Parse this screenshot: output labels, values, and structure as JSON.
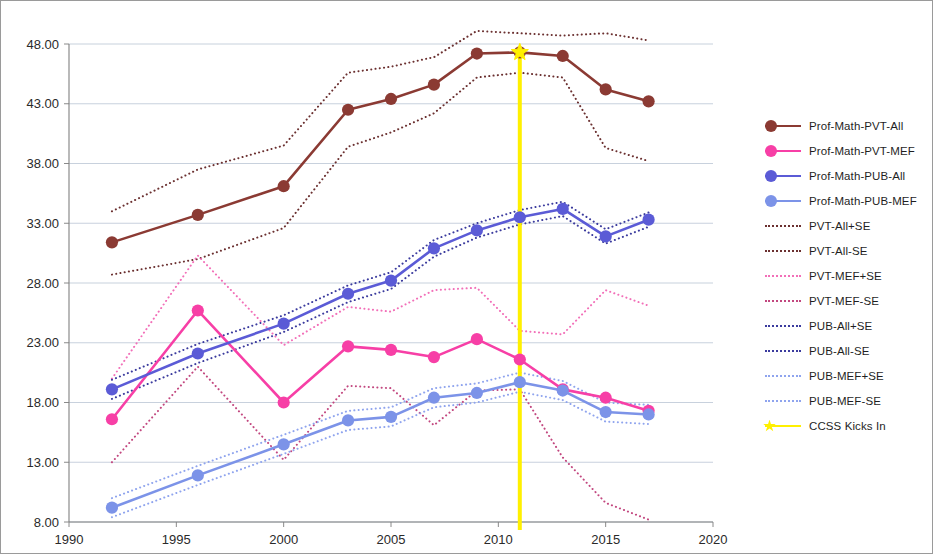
{
  "chart_data": {
    "type": "line",
    "title": "",
    "xlabel": "",
    "ylabel": "",
    "xlim": [
      1990,
      2020
    ],
    "ylim": [
      8,
      48
    ],
    "xticks": [
      1990,
      1995,
      2000,
      2005,
      2010,
      2015,
      2020
    ],
    "yticks": [
      "8.00",
      "13.00",
      "18.00",
      "23.00",
      "28.00",
      "33.00",
      "38.00",
      "43.00",
      "48.00"
    ],
    "grid": true,
    "legend_position": "right",
    "x": [
      1992,
      1996,
      2000,
      2003,
      2005,
      2007,
      2009,
      2011,
      2013,
      2015,
      2017
    ],
    "series": [
      {
        "name": "Prof-Math-PVT-All",
        "color": "#8B3A33",
        "style": "solid-marker",
        "values": [
          31.4,
          33.7,
          36.1,
          42.5,
          43.4,
          44.6,
          47.2,
          47.3,
          47.0,
          44.2,
          43.2
        ]
      },
      {
        "name": "Prof-Math-PVT-MEF",
        "color": "#F73FA6",
        "style": "solid-marker",
        "values": [
          16.6,
          25.7,
          18.0,
          22.7,
          22.4,
          21.8,
          23.3,
          21.6,
          19.1,
          18.4,
          17.3
        ]
      },
      {
        "name": "Prof-Math-PUB-All",
        "color": "#5B5BD6",
        "style": "solid-marker",
        "values": [
          19.1,
          22.1,
          24.6,
          27.1,
          28.2,
          30.9,
          32.4,
          33.5,
          34.2,
          31.9,
          33.3
        ]
      },
      {
        "name": "Prof-Math-PUB-MEF",
        "color": "#7C93E8",
        "style": "solid-marker",
        "values": [
          9.2,
          11.9,
          14.5,
          16.5,
          16.8,
          18.4,
          18.8,
          19.7,
          19.0,
          17.2,
          17.0
        ]
      },
      {
        "name": "PVT-All+SE",
        "color": "#6B3030",
        "style": "dotted",
        "values": [
          34.0,
          37.5,
          39.5,
          45.6,
          46.1,
          46.9,
          49.1,
          48.9,
          48.7,
          48.9,
          48.3
        ]
      },
      {
        "name": "PVT-All-SE",
        "color": "#6B3030",
        "style": "dotted",
        "values": [
          28.7,
          30.0,
          32.6,
          39.4,
          40.6,
          42.2,
          45.2,
          45.6,
          45.2,
          39.3,
          38.2
        ]
      },
      {
        "name": "PVT-MEF+SE",
        "color": "#F26FB8",
        "style": "dotted",
        "values": [
          20.0,
          30.3,
          22.8,
          26.0,
          25.6,
          27.4,
          27.6,
          24.0,
          23.7,
          27.4,
          26.1
        ]
      },
      {
        "name": "PVT-MEF-SE",
        "color": "#C2477F",
        "style": "dotted",
        "values": [
          13.0,
          21.0,
          13.2,
          19.4,
          19.2,
          16.1,
          19.0,
          19.1,
          13.4,
          9.6,
          8.2
        ]
      },
      {
        "name": "PUB-All+SE",
        "color": "#3B3B9E",
        "style": "dotted",
        "values": [
          19.9,
          22.9,
          25.3,
          27.8,
          28.9,
          31.6,
          33.0,
          34.1,
          34.8,
          32.5,
          33.9
        ]
      },
      {
        "name": "PUB-All-SE",
        "color": "#3B3B9E",
        "style": "dotted",
        "values": [
          18.3,
          21.3,
          23.9,
          26.4,
          27.5,
          30.2,
          31.8,
          32.9,
          33.6,
          31.3,
          32.7
        ]
      },
      {
        "name": "PUB-MEF+SE",
        "color": "#8FA4EE",
        "style": "dotted",
        "values": [
          10.0,
          12.7,
          15.3,
          17.3,
          17.6,
          19.2,
          19.6,
          20.5,
          19.8,
          18.0,
          17.8
        ]
      },
      {
        "name": "PUB-MEF-SE",
        "color": "#8FA4EE",
        "style": "dotted",
        "values": [
          8.4,
          11.1,
          13.7,
          15.7,
          16.0,
          17.6,
          18.0,
          18.9,
          18.2,
          16.4,
          16.2
        ]
      }
    ],
    "annotations": [
      {
        "name": "CCSS Kicks In",
        "type": "vline",
        "x": 2011,
        "color": "#FFF000",
        "marker_y": 47.3
      }
    ]
  },
  "legend": {
    "items": [
      {
        "label": "Prof-Math-PVT-All",
        "color": "#8B3A33",
        "style": "solid-marker",
        "key": "legend-key-pvt-all"
      },
      {
        "label": "Prof-Math-PVT-MEF",
        "color": "#F73FA6",
        "style": "solid-marker",
        "key": "legend-key-pvt-mef"
      },
      {
        "label": "Prof-Math-PUB-All",
        "color": "#5B5BD6",
        "style": "solid-marker",
        "key": "legend-key-pub-all"
      },
      {
        "label": "Prof-Math-PUB-MEF",
        "color": "#7C93E8",
        "style": "solid-marker",
        "key": "legend-key-pub-mef"
      },
      {
        "label": "PVT-All+SE",
        "color": "#6B3030",
        "style": "dotted",
        "key": "legend-key-pvt-all-plus-se"
      },
      {
        "label": "PVT-All-SE",
        "color": "#6B3030",
        "style": "dotted",
        "key": "legend-key-pvt-all-minus-se"
      },
      {
        "label": "PVT-MEF+SE",
        "color": "#F26FB8",
        "style": "dotted",
        "key": "legend-key-pvt-mef-plus-se"
      },
      {
        "label": "PVT-MEF-SE",
        "color": "#C2477F",
        "style": "dotted",
        "key": "legend-key-pvt-mef-minus-se"
      },
      {
        "label": "PUB-All+SE",
        "color": "#3B3B9E",
        "style": "dotted",
        "key": "legend-key-pub-all-plus-se"
      },
      {
        "label": "PUB-All-SE",
        "color": "#3B3B9E",
        "style": "dotted",
        "key": "legend-key-pub-all-minus-se"
      },
      {
        "label": "PUB-MEF+SE",
        "color": "#8FA4EE",
        "style": "dotted",
        "key": "legend-key-pub-mef-plus-se"
      },
      {
        "label": "PUB-MEF-SE",
        "color": "#8FA4EE",
        "style": "dotted",
        "key": "legend-key-pub-mef-minus-se"
      },
      {
        "label": "CCSS Kicks In",
        "color": "#FFF000",
        "style": "solid-marker",
        "key": "legend-key-ccss"
      }
    ]
  },
  "axes": {
    "gridline_color": "#B8C4D4",
    "axis_color": "#808080",
    "tick_text_color": "#2a2a2a"
  }
}
